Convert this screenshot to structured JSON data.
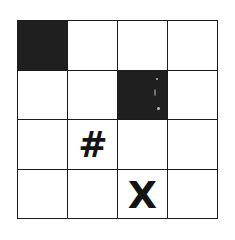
{
  "figure": {
    "background_color": "#ffffff",
    "ink_color": "#1c1c1c",
    "fill_color": "#1f1f1f",
    "rows": 4,
    "columns": 4,
    "grid_line_width_px": 3
  },
  "grid": {
    "cells": [
      [
        {
          "id": "r1c1",
          "state": "filled",
          "glyph": ""
        },
        {
          "id": "r1c2",
          "state": "empty",
          "glyph": ""
        },
        {
          "id": "r1c3",
          "state": "empty",
          "glyph": ""
        },
        {
          "id": "r1c4",
          "state": "empty",
          "glyph": ""
        }
      ],
      [
        {
          "id": "r2c1",
          "state": "empty",
          "glyph": ""
        },
        {
          "id": "r2c2",
          "state": "empty",
          "glyph": ""
        },
        {
          "id": "r2c3",
          "state": "filled",
          "glyph": ""
        },
        {
          "id": "r2c4",
          "state": "empty",
          "glyph": ""
        }
      ],
      [
        {
          "id": "r3c1",
          "state": "empty",
          "glyph": ""
        },
        {
          "id": "r3c2",
          "state": "symbol",
          "glyph": "#"
        },
        {
          "id": "r3c3",
          "state": "empty",
          "glyph": ""
        },
        {
          "id": "r3c4",
          "state": "empty",
          "glyph": ""
        }
      ],
      [
        {
          "id": "r4c1",
          "state": "empty",
          "glyph": ""
        },
        {
          "id": "r4c2",
          "state": "empty",
          "glyph": ""
        },
        {
          "id": "r4c3",
          "state": "symbol",
          "glyph": "X"
        },
        {
          "id": "r4c4",
          "state": "empty",
          "glyph": ""
        }
      ]
    ]
  }
}
